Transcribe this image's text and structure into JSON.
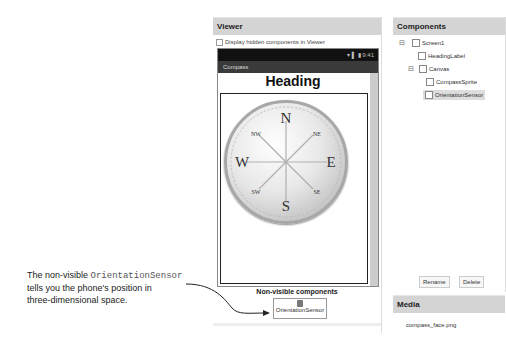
{
  "viewer": {
    "header": "Viewer",
    "checkbox_label": "Display hidden components in Viewer",
    "phone": {
      "status_text": "▾ ▌ ▮ 9:41",
      "app_title": "Compass",
      "heading_label": "Heading",
      "compass_letters": {
        "n": "N",
        "e": "E",
        "s": "S",
        "w": "W",
        "ne": "NE",
        "nw": "NW",
        "se": "SE",
        "sw": "SW"
      }
    },
    "non_visible_title": "Non-visible components",
    "non_visible_items": [
      "OrientationSensor"
    ]
  },
  "components": {
    "header": "Components",
    "tree": [
      {
        "label": "Screen1",
        "toggle": "⊟",
        "level": 0
      },
      {
        "label": "HeadingLabel",
        "level": 1
      },
      {
        "label": "Canvas",
        "toggle": "⊟",
        "level": 1
      },
      {
        "label": "CompassSprite",
        "level": 2
      },
      {
        "label": "OrientationSensor",
        "level": 2,
        "selected": true
      }
    ],
    "rename_label": "Rename",
    "delete_label": "Delete"
  },
  "media": {
    "header": "Media",
    "files": [
      "compass_face.png"
    ]
  },
  "callout": {
    "line1_prefix": "The non-visible ",
    "line1_code": "OrientationSensor",
    "line2": "tells you the phone's position in",
    "line3": "three-dimensional space."
  }
}
